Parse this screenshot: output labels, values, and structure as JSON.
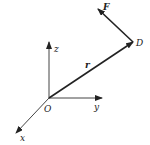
{
  "diagram": {
    "type": "vector-diagram",
    "colors": {
      "line": "#222222",
      "axis": "#444444",
      "background": "#ffffff"
    },
    "origin": {
      "label": "O",
      "x": 49,
      "y": 98
    },
    "axes": [
      {
        "name": "z",
        "label": "z",
        "tip": [
          49,
          42
        ]
      },
      {
        "name": "y",
        "label": "y",
        "tip": [
          102,
          98
        ]
      },
      {
        "name": "x",
        "label": "x",
        "tip": [
          16,
          133
        ]
      }
    ],
    "vectors": [
      {
        "name": "r",
        "label": "r",
        "bold": true,
        "from": [
          49,
          98
        ],
        "to": [
          133,
          42
        ]
      },
      {
        "name": "F",
        "label": "F",
        "bold": true,
        "from": [
          133,
          42
        ],
        "to": [
          98,
          9
        ]
      }
    ],
    "points": [
      {
        "name": "D",
        "label": "D",
        "x": 133,
        "y": 42
      }
    ]
  }
}
